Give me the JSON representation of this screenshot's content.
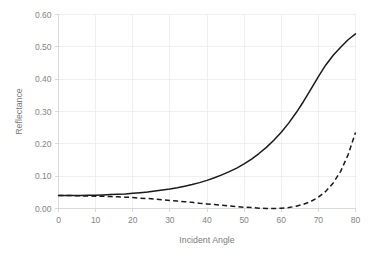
{
  "chart_data": {
    "type": "line",
    "title": "",
    "subtitle": "",
    "xlabel": "Incident Angle",
    "ylabel": "Reflectance",
    "xlim": [
      0,
      80
    ],
    "ylim": [
      0.0,
      0.6
    ],
    "grid": true,
    "legend_position": "none",
    "x_ticks": [
      0,
      10,
      20,
      30,
      40,
      50,
      60,
      70,
      80
    ],
    "x_tick_labels": [
      "0",
      "10",
      "20",
      "30",
      "40",
      "50",
      "60",
      "70",
      "80"
    ],
    "y_ticks": [
      0.0,
      0.1,
      0.2,
      0.3,
      0.4,
      0.5,
      0.6
    ],
    "y_tick_labels": [
      "0.00",
      "0.10",
      "0.20",
      "0.30",
      "0.40",
      "0.50",
      "0.60"
    ],
    "x": [
      0,
      2,
      4,
      6,
      8,
      10,
      12,
      14,
      16,
      18,
      20,
      22,
      24,
      26,
      28,
      30,
      32,
      34,
      36,
      38,
      40,
      42,
      44,
      46,
      48,
      50,
      52,
      54,
      56,
      58,
      60,
      62,
      64,
      66,
      68,
      70,
      72,
      74,
      76,
      78,
      80
    ],
    "series": [
      {
        "name": "s-polarized",
        "style": "solid",
        "color": "#1a1a1a",
        "values": [
          0.04,
          0.04,
          0.04,
          0.04,
          0.041,
          0.041,
          0.042,
          0.043,
          0.044,
          0.045,
          0.047,
          0.049,
          0.051,
          0.054,
          0.057,
          0.06,
          0.064,
          0.069,
          0.074,
          0.08,
          0.087,
          0.095,
          0.104,
          0.114,
          0.125,
          0.138,
          0.153,
          0.17,
          0.189,
          0.211,
          0.236,
          0.264,
          0.296,
          0.331,
          0.369,
          0.408,
          0.444,
          0.474,
          0.499,
          0.522,
          0.54
        ]
      },
      {
        "name": "p-polarized",
        "style": "dashed",
        "color": "#1a1a1a",
        "values": [
          0.04,
          0.04,
          0.04,
          0.039,
          0.039,
          0.038,
          0.038,
          0.037,
          0.036,
          0.035,
          0.034,
          0.032,
          0.031,
          0.029,
          0.027,
          0.025,
          0.023,
          0.021,
          0.019,
          0.016,
          0.014,
          0.012,
          0.01,
          0.008,
          0.006,
          0.004,
          0.003,
          0.001,
          0.0,
          0.0,
          0.001,
          0.003,
          0.007,
          0.013,
          0.022,
          0.035,
          0.053,
          0.079,
          0.115,
          0.166,
          0.235
        ]
      }
    ],
    "annotations": []
  }
}
